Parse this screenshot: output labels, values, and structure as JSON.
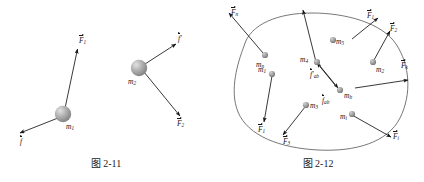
{
  "figures": [
    {
      "id": "fig-2-11",
      "caption": "图 2-11",
      "description": "两个质点受力图",
      "masses": [
        {
          "name": "m1",
          "base": "m",
          "sub": "1"
        },
        {
          "name": "m2",
          "base": "m",
          "sub": "2"
        }
      ],
      "forces": [
        {
          "name": "F1",
          "base": "F",
          "sub": "1",
          "prime": false
        },
        {
          "name": "f",
          "base": "f",
          "sub": "",
          "prime": false
        },
        {
          "name": "f-prime",
          "base": "f",
          "sub": "",
          "prime": true
        },
        {
          "name": "F2",
          "base": "F",
          "sub": "2",
          "prime": false
        }
      ]
    },
    {
      "id": "fig-2-12",
      "caption": "图 2-12",
      "description": "质点系内力与外力示意图",
      "masses": [
        {
          "name": "mn",
          "base": "m",
          "sub": "n"
        },
        {
          "name": "m5",
          "base": "m",
          "sub": "5"
        },
        {
          "name": "m2",
          "base": "m",
          "sub": "2"
        },
        {
          "name": "m1",
          "base": "m",
          "sub": "1"
        },
        {
          "name": "m4",
          "base": "m",
          "sub": "4"
        },
        {
          "name": "mb",
          "base": "m",
          "sub": "b"
        },
        {
          "name": "m3",
          "base": "m",
          "sub": "3"
        },
        {
          "name": "mi",
          "base": "m",
          "sub": "i"
        }
      ],
      "external_forces": [
        {
          "name": "Fn",
          "base": "F",
          "sub": "n",
          "prime": false
        },
        {
          "name": "F1-top",
          "base": "F",
          "sub": "1",
          "prime": false
        },
        {
          "name": "F2",
          "base": "F",
          "sub": "2",
          "prime": false
        },
        {
          "name": "Fk",
          "base": "F",
          "sub": "k",
          "prime": false
        },
        {
          "name": "F1-bottom",
          "base": "F",
          "sub": "1",
          "prime": false
        },
        {
          "name": "F3",
          "base": "F",
          "sub": "3",
          "prime": false
        },
        {
          "name": "Fi",
          "base": "F",
          "sub": "i",
          "prime": false
        }
      ],
      "internal_forces": [
        {
          "name": "f-ab-prime",
          "base": "f",
          "sub": "ab",
          "prime": true
        },
        {
          "name": "f-ab",
          "base": "f",
          "sub": "ab",
          "prime": false
        }
      ]
    }
  ],
  "colors": {
    "ink": "#151515",
    "boundary": "#4a4a4a",
    "mass_fill": "#9a9a9a"
  }
}
